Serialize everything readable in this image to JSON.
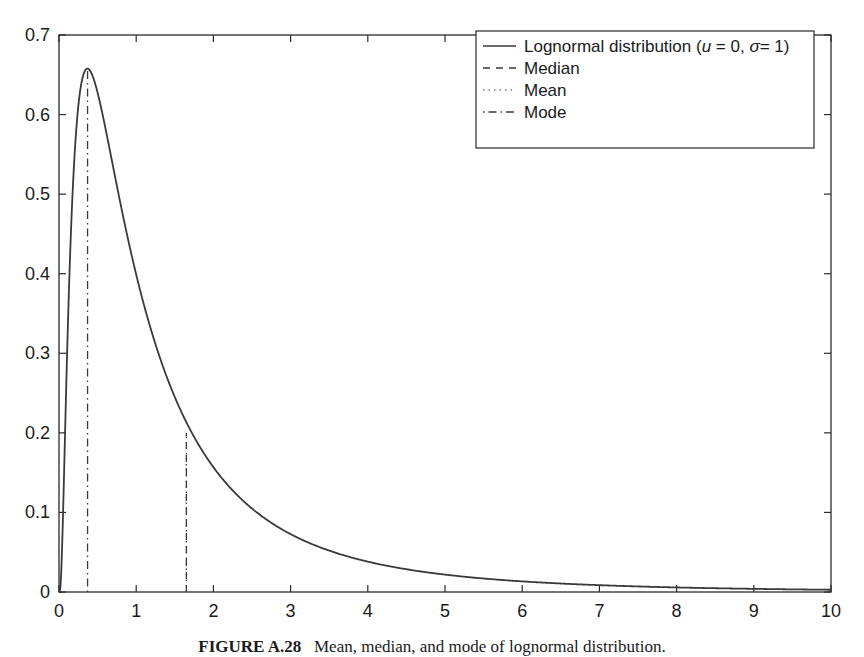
{
  "chart_data": {
    "type": "line",
    "title": "",
    "xlabel": "",
    "ylabel": "",
    "xlim": [
      0,
      10
    ],
    "ylim": [
      0,
      0.7
    ],
    "grid": false,
    "legend_position": "upper right",
    "x_ticks": [
      "0",
      "1",
      "2",
      "3",
      "4",
      "5",
      "6",
      "7",
      "8",
      "9",
      "10"
    ],
    "y_ticks": [
      "0",
      "0.1",
      "0.2",
      "0.3",
      "0.4",
      "0.5",
      "0.6",
      "0.7"
    ],
    "series": [
      {
        "name": "Lognormal distribution (u = 0, σ = 1)",
        "style": "solid",
        "x": [
          0,
          0.05,
          0.1,
          0.15,
          0.2,
          0.25,
          0.3,
          0.368,
          0.45,
          0.55,
          0.65,
          0.8,
          1.0,
          1.2,
          1.4,
          1.65,
          2.0,
          2.5,
          3.0,
          3.5,
          4.0,
          4.5,
          5.0,
          6.0,
          7.0,
          8.0,
          9.0,
          10.0
        ],
        "values": [
          0,
          0.0898,
          0.2815,
          0.4417,
          0.5462,
          0.6072,
          0.6389,
          0.6577,
          0.6475,
          0.6065,
          0.5505,
          0.4687,
          0.3989,
          0.3221,
          0.2673,
          0.213,
          0.1569,
          0.1048,
          0.0727,
          0.0521,
          0.0381,
          0.0288,
          0.0219,
          0.0132,
          0.0085,
          0.0054,
          0.0036,
          0.0028
        ]
      },
      {
        "name": "Median",
        "style": "dashed",
        "x": [
          1.65,
          1.65
        ],
        "values": [
          0,
          0.2
        ]
      },
      {
        "name": "Mean",
        "style": "dotted",
        "x": [
          1.65,
          1.65
        ],
        "values": [
          0,
          0.2
        ]
      },
      {
        "name": "Mode",
        "style": "dash-dot",
        "x": [
          0.37,
          0.37
        ],
        "values": [
          0,
          0.657
        ]
      }
    ]
  },
  "legend": {
    "items": [
      {
        "label_main": "Lognormal distribution (",
        "label_u": "u",
        "label_mid": " = 0, ",
        "label_sigma": "σ",
        "label_end": "= 1)",
        "style": "solid"
      },
      {
        "label": "Median",
        "style": "dashed"
      },
      {
        "label": "Mean",
        "style": "dotted"
      },
      {
        "label": "Mode",
        "style": "dash-dot"
      }
    ]
  },
  "caption": {
    "prefix": "FIGURE A.28",
    "text": "Mean, median, and mode of lognormal distribution."
  },
  "colors": {
    "line": "#3a3a3a",
    "axis": "#2a2a2a",
    "text": "#1a1a1a"
  }
}
